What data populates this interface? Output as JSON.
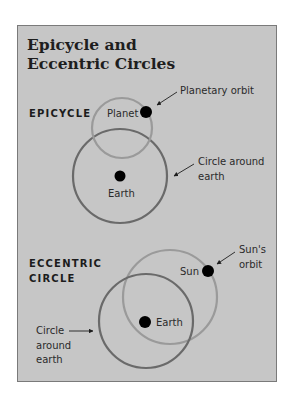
{
  "title": {
    "line1": "Epicycle and",
    "line2": "Eccentric Circles"
  },
  "colors": {
    "page_background": "#ffffff",
    "panel_background": "#c6c6c6",
    "panel_border": "#7a7a7a",
    "light_circle": "#9a9a9a",
    "dark_circle": "#6a6a6a",
    "dot": "#000000",
    "text": "#1e1e1e"
  },
  "epicycle": {
    "heading": "EPICYCLE",
    "planet_label": "Planet",
    "earth_label": "Earth",
    "planetary_orbit_label": "Planetary orbit",
    "circle_around_earth_label_line1": "Circle around",
    "circle_around_earth_label_line2": "earth"
  },
  "eccentric": {
    "heading_line1": "ECCENTRIC",
    "heading_line2": "CIRCLE",
    "sun_label": "Sun",
    "earth_label": "Earth",
    "suns_orbit_label_line1": "Sun's",
    "suns_orbit_label_line2": "orbit",
    "circle_around_earth_label_line1": "Circle",
    "circle_around_earth_label_line2": "around",
    "circle_around_earth_label_line3": "earth"
  }
}
